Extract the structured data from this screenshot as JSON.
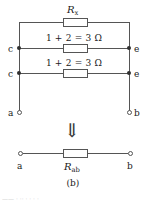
{
  "figure": {
    "caption": "(b)",
    "top_circuit": {
      "branches": [
        {
          "id": "top",
          "label": "R",
          "label_sub": "x",
          "label_full": "Rx"
        },
        {
          "id": "middle",
          "label": "1 + 2 = 3 Ω"
        },
        {
          "id": "lower",
          "label": "1 + 2 = 3 Ω"
        }
      ],
      "left_nodes": [
        {
          "label": "c",
          "type": "solid-dot"
        },
        {
          "label": "c",
          "type": "solid-dot"
        }
      ],
      "right_nodes": [
        {
          "label": "e",
          "type": "solid-dot"
        },
        {
          "label": "e",
          "type": "solid-dot"
        }
      ],
      "terminals": [
        {
          "label": "a",
          "type": "open-circle"
        },
        {
          "label": "b",
          "type": "open-circle"
        }
      ]
    },
    "transform_arrow": "⇓",
    "bottom_circuit": {
      "resistor_label": "R",
      "resistor_label_sub": "ab",
      "resistor_label_full": "Rab",
      "terminals": [
        {
          "label": "a",
          "type": "open-circle"
        },
        {
          "label": "b",
          "type": "open-circle"
        }
      ]
    },
    "edge_artifact": "—— · ·· · · · ·"
  },
  "colors": {
    "background": "#ffffff",
    "wire": "#555555",
    "node": "#303030",
    "text": "#1a1a1a"
  }
}
